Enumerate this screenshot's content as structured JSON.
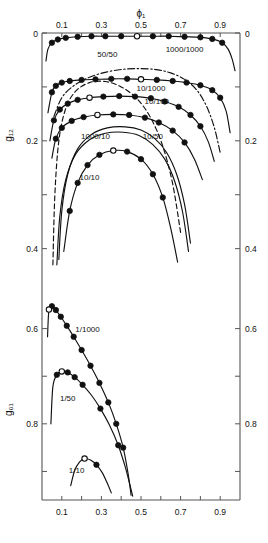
{
  "figure": {
    "title": "",
    "xaxis_label": "ϕ₁",
    "upper_yaxis_label": "g₁₂",
    "lower_yaxis_label": "g₀₁"
  },
  "chart_data": {
    "type": "line",
    "title": "",
    "xlabel": "ϕ₁",
    "grid": false,
    "legend": "inline curve labels",
    "panels": [
      {
        "name": "upper",
        "ylabel": "g₁₂",
        "ylim": [
          0,
          0.46
        ],
        "y_inverted": true,
        "xlim": [
          0,
          1
        ],
        "xticks": [
          0.1,
          0.2,
          0.3,
          0.4,
          0.5,
          0.6,
          0.7,
          0.8,
          0.9
        ],
        "xticklabels": [
          "0.1",
          "0.3",
          "0.5",
          "0.7",
          "0.9"
        ],
        "xticklabel_values": [
          0.1,
          0.3,
          0.5,
          0.7,
          0.9
        ],
        "yticks": [
          0,
          0.1,
          0.2,
          0.3,
          0.4
        ],
        "yticklabels": [
          "0",
          "0.2",
          "0.4"
        ],
        "yticklabel_values": [
          0,
          0.2,
          0.4
        ],
        "series": [
          {
            "name": "1000/1000",
            "label": "1000/1000",
            "style": "solid",
            "marker": "filled-circle",
            "label_x": 0.72,
            "label_y": 0.035,
            "x": [
              0.02,
              0.03,
              0.05,
              0.08,
              0.12,
              0.18,
              0.25,
              0.32,
              0.4,
              0.48,
              0.56,
              0.64,
              0.72,
              0.8,
              0.86,
              0.91,
              0.94,
              0.96,
              0.975
            ],
            "y": [
              0.052,
              0.03,
              0.018,
              0.012,
              0.009,
              0.007,
              0.006,
              0.006,
              0.006,
              0.006,
              0.006,
              0.006,
              0.007,
              0.008,
              0.011,
              0.018,
              0.03,
              0.048,
              0.07
            ],
            "markers_filled_x": [
              0.05,
              0.08,
              0.12,
              0.18,
              0.25,
              0.32,
              0.4,
              0.56,
              0.64,
              0.72,
              0.8,
              0.86,
              0.91
            ],
            "markers_open_x": [
              0.48
            ]
          },
          {
            "name": "50/50",
            "label": "50/50",
            "style": "solid",
            "marker": "filled-circle",
            "label_x": 0.33,
            "label_y": 0.045,
            "x": [
              0.03,
              0.05,
              0.07,
              0.1,
              0.14,
              0.2,
              0.27,
              0.35,
              0.43,
              0.5,
              0.58,
              0.66,
              0.73,
              0.8,
              0.86,
              0.9,
              0.93,
              0.95
            ],
            "y": [
              0.148,
              0.11,
              0.098,
              0.092,
              0.089,
              0.087,
              0.086,
              0.085,
              0.085,
              0.086,
              0.087,
              0.089,
              0.092,
              0.097,
              0.106,
              0.12,
              0.145,
              0.185
            ],
            "markers_filled_x": [
              0.05,
              0.07,
              0.1,
              0.14,
              0.2,
              0.27,
              0.35,
              0.43,
              0.58,
              0.66,
              0.73,
              0.8,
              0.86,
              0.9
            ],
            "markers_open_x": [
              0.5
            ]
          },
          {
            "name": "1000/100-dashdot",
            "label": "",
            "style": "dashdot",
            "marker": "none",
            "x": [
              0.06,
              0.1,
              0.16,
              0.24,
              0.33,
              0.42,
              0.5,
              0.58,
              0.65,
              0.72,
              0.78,
              0.83,
              0.87,
              0.9
            ],
            "y": [
              0.155,
              0.12,
              0.098,
              0.082,
              0.072,
              0.067,
              0.066,
              0.068,
              0.074,
              0.086,
              0.105,
              0.135,
              0.175,
              0.222
            ]
          },
          {
            "name": "10/1000",
            "label": "10/1000",
            "style": "solid",
            "marker": "filled-circle",
            "label_x": 0.55,
            "label_y": 0.108,
            "x": [
              0.04,
              0.06,
              0.09,
              0.13,
              0.18,
              0.24,
              0.31,
              0.39,
              0.47,
              0.55,
              0.62,
              0.69,
              0.75,
              0.8,
              0.84,
              0.87
            ],
            "y": [
              0.2,
              0.162,
              0.142,
              0.131,
              0.124,
              0.12,
              0.118,
              0.117,
              0.118,
              0.121,
              0.127,
              0.137,
              0.152,
              0.173,
              0.202,
              0.238
            ],
            "markers_filled_x": [
              0.06,
              0.09,
              0.13,
              0.18,
              0.31,
              0.39,
              0.47,
              0.55,
              0.62,
              0.69,
              0.75,
              0.8
            ],
            "markers_open_x": [
              0.24
            ]
          },
          {
            "name": "10/100",
            "label": "10/100",
            "style": "solid",
            "marker": "filled-circle",
            "label_x": 0.58,
            "label_y": 0.132,
            "x": [
              0.05,
              0.07,
              0.1,
              0.15,
              0.21,
              0.28,
              0.36,
              0.44,
              0.52,
              0.59,
              0.66,
              0.72,
              0.77,
              0.81
            ],
            "y": [
              0.232,
              0.196,
              0.176,
              0.163,
              0.156,
              0.152,
              0.151,
              0.152,
              0.157,
              0.166,
              0.181,
              0.203,
              0.234,
              0.272
            ],
            "markers_filled_x": [
              0.07,
              0.1,
              0.15,
              0.21,
              0.36,
              0.44,
              0.52,
              0.59,
              0.66,
              0.72
            ],
            "markers_open_x": [
              0.28
            ]
          },
          {
            "name": "1000/10",
            "label": "1000/10",
            "style": "solid",
            "marker": "none",
            "label_x": 0.27,
            "label_y": 0.196,
            "x": [
              0.085,
              0.1,
              0.13,
              0.18,
              0.25,
              0.33,
              0.42,
              0.5,
              0.57,
              0.63,
              0.68,
              0.72,
              0.75
            ],
            "y": [
              0.42,
              0.33,
              0.262,
              0.215,
              0.188,
              0.176,
              0.174,
              0.18,
              0.196,
              0.222,
              0.262,
              0.318,
              0.39
            ]
          },
          {
            "name": "10/50",
            "label": "10/50",
            "style": "solid",
            "marker": "none",
            "label_x": 0.56,
            "label_y": 0.196,
            "x": [
              0.075,
              0.09,
              0.12,
              0.17,
              0.24,
              0.32,
              0.41,
              0.49,
              0.56,
              0.62,
              0.67,
              0.71,
              0.74
            ],
            "y": [
              0.43,
              0.34,
              0.272,
              0.225,
              0.198,
              0.186,
              0.184,
              0.19,
              0.207,
              0.234,
              0.275,
              0.332,
              0.405
            ]
          },
          {
            "name": "100/10-dashed",
            "label": "",
            "style": "dashed",
            "marker": "none",
            "x": [
              0.055,
              0.065,
              0.085,
              0.12,
              0.17,
              0.24,
              0.32,
              0.4,
              0.48,
              0.55,
              0.61,
              0.66,
              0.7
            ],
            "y": [
              0.43,
              0.3,
              0.2,
              0.14,
              0.108,
              0.092,
              0.09,
              0.1,
              0.122,
              0.158,
              0.21,
              0.28,
              0.37
            ]
          },
          {
            "name": "10/10",
            "label": "10/10",
            "style": "solid",
            "marker": "filled-circle",
            "label_x": 0.24,
            "label_y": 0.272,
            "x": [
              0.11,
              0.14,
              0.18,
              0.23,
              0.29,
              0.36,
              0.43,
              0.5,
              0.56,
              0.61,
              0.65,
              0.685
            ],
            "y": [
              0.405,
              0.33,
              0.278,
              0.245,
              0.226,
              0.218,
              0.22,
              0.234,
              0.262,
              0.305,
              0.362,
              0.425
            ],
            "markers_filled_x": [
              0.14,
              0.18,
              0.23,
              0.29,
              0.43,
              0.5,
              0.56,
              0.61
            ],
            "markers_open_x": [
              0.36
            ]
          }
        ]
      },
      {
        "name": "lower",
        "ylabel": "g₀₁",
        "ylim": [
          0.5,
          0.96
        ],
        "y_inverted": true,
        "xlim": [
          0,
          1
        ],
        "xticks": [
          0.1,
          0.2,
          0.3,
          0.4,
          0.5,
          0.6,
          0.7,
          0.8,
          0.9
        ],
        "xticklabels": [
          "0.1",
          "0.3",
          "0.5",
          "0.7",
          "0.9"
        ],
        "xticklabel_values": [
          0.1,
          0.3,
          0.5,
          0.7,
          0.9
        ],
        "yticks": [
          0.6,
          0.7,
          0.8,
          0.9
        ],
        "yticklabels": [
          "0.6",
          "0.8"
        ],
        "yticklabel_values": [
          0.6,
          0.8
        ],
        "series": [
          {
            "name": "1/1000",
            "label": "1/1000",
            "style": "solid",
            "marker": "filled-circle",
            "label_x": 0.23,
            "label_y": 0.607,
            "x": [
              0.028,
              0.035,
              0.05,
              0.07,
              0.095,
              0.125,
              0.16,
              0.2,
              0.245,
              0.29,
              0.335,
              0.375,
              0.41,
              0.435,
              0.45
            ],
            "y": [
              0.617,
              0.56,
              0.553,
              0.561,
              0.575,
              0.594,
              0.617,
              0.645,
              0.678,
              0.714,
              0.755,
              0.8,
              0.85,
              0.905,
              0.95
            ],
            "markers_filled_x": [
              0.05,
              0.07,
              0.095,
              0.125,
              0.16,
              0.2,
              0.245,
              0.29,
              0.335,
              0.375,
              0.41
            ],
            "markers_open_x": [
              0.035
            ]
          },
          {
            "name": "1/50",
            "label": "1/50",
            "style": "solid",
            "marker": "filled-circle",
            "label_x": 0.13,
            "label_y": 0.752,
            "x": [
              0.045,
              0.055,
              0.075,
              0.1,
              0.13,
              0.165,
              0.205,
              0.25,
              0.295,
              0.34,
              0.385,
              0.42,
              0.445,
              0.458
            ],
            "y": [
              0.8,
              0.722,
              0.697,
              0.69,
              0.692,
              0.702,
              0.718,
              0.74,
              0.768,
              0.802,
              0.845,
              0.89,
              0.93,
              0.952
            ],
            "markers_filled_x": [
              0.075,
              0.13,
              0.165,
              0.205,
              0.295,
              0.385
            ],
            "markers_open_x": [
              0.1
            ]
          },
          {
            "name": "1/10",
            "label": "1/10",
            "style": "solid",
            "marker": "filled-circle",
            "label_x": 0.175,
            "label_y": 0.903,
            "x": [
              0.145,
              0.165,
              0.19,
              0.215,
              0.245,
              0.275,
              0.305,
              0.33,
              0.35
            ],
            "y": [
              0.93,
              0.898,
              0.88,
              0.873,
              0.876,
              0.886,
              0.903,
              0.925,
              0.945
            ],
            "markers_filled_x": [
              0.275
            ],
            "markers_open_x": [
              0.215
            ]
          }
        ]
      }
    ]
  }
}
